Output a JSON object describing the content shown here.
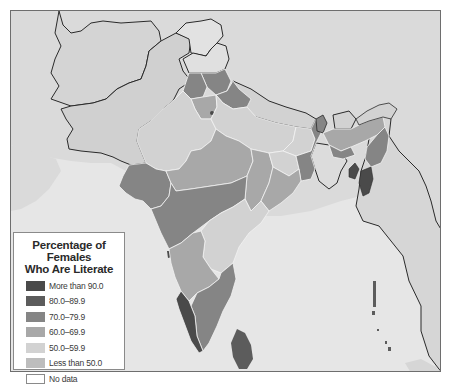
{
  "map": {
    "subject": "Female literacy by state, India and neighboring region",
    "colors": {
      "background_land": "#dcdcdc",
      "sea": "#e8e8e8",
      "neighbor_country": "#d6d6d6",
      "border_dark": "#2a2a2a",
      "state_border": "#f2f2f2",
      "frame_border": "#6e6e6e"
    }
  },
  "legend": {
    "title_line1": "Percentage of Females",
    "title_line2": "Who Are Literate",
    "items": [
      {
        "label": "More than 90.0",
        "color": "#4a4a4a"
      },
      {
        "label": "80.0–89.9",
        "color": "#5c5c5c"
      },
      {
        "label": "70.0–79.9",
        "color": "#858585"
      },
      {
        "label": "60.0–69.9",
        "color": "#a8a8a8"
      },
      {
        "label": "50.0–59.9",
        "color": "#d2d2d2"
      },
      {
        "label": "Less than 50.0",
        "color": "#bdbdbd"
      },
      {
        "label": "No data",
        "color": "#ffffff"
      }
    ]
  }
}
